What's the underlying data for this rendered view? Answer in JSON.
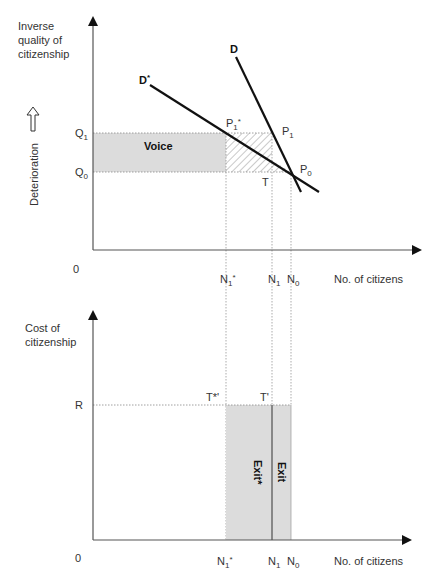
{
  "top_panel": {
    "y_axis_label": [
      "Inverse",
      "quality of",
      "citizenship"
    ],
    "side_label": "Deterioration",
    "side_arrow_icon": "up-hollow-arrow",
    "origin": "0",
    "x_axis_label": "No. of citizens",
    "y_ticks": {
      "q1": "Q",
      "q1_sub": "1",
      "q0": "Q",
      "q0_sub": "0"
    },
    "x_ticks": {
      "n1star": "N",
      "n1star_sub": "1",
      "n1star_sup": "*",
      "n1": "N",
      "n1_sub": "1",
      "n0": "N",
      "n0_sub": "0"
    },
    "curves": {
      "d": "D",
      "dstar": "D",
      "dstar_sup": "*"
    },
    "points": {
      "p1star": "P",
      "p1star_sub": "1",
      "p1star_sup": "*",
      "p1": "P",
      "p1_sub": "1",
      "p0": "P",
      "p0_sub": "0",
      "t": "T"
    },
    "region_label": "Voice"
  },
  "bottom_panel": {
    "y_axis_label": [
      "Cost of",
      "citizenship"
    ],
    "origin": "0",
    "x_axis_label": "No. of citizens",
    "y_tick": "R",
    "x_ticks": {
      "n1star": "N",
      "n1star_sub": "1",
      "n1star_sup": "*",
      "n1": "N",
      "n1_sub": "1",
      "n0": "N",
      "n0_sub": "0"
    },
    "points": {
      "tstar": "T*'",
      "t": "T'"
    },
    "regions": {
      "exit_star": "Exit*",
      "exit": "Exit"
    }
  },
  "colors": {
    "shade": "#dcdcdc",
    "line": "#111111",
    "axis": "#555555",
    "dotted": "#888888"
  }
}
